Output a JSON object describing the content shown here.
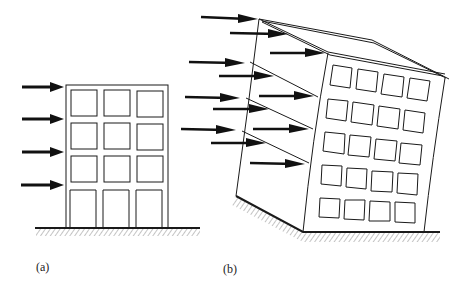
{
  "figure": {
    "panels": [
      {
        "id": "a",
        "label": "(a)",
        "description": "Upright 4-storey, 3-bay building frame with 4 lateral load arrows on its left side, standing on hatched ground",
        "storeys": 4,
        "bays": 3,
        "load_arrows": 4
      },
      {
        "id": "b",
        "label": "(b)",
        "description": "Perspective view of a 5-storey building deformed (tilted/swayed) under lateral wind loads, with many arrows acting on the side face, resting on hatched ground",
        "storeys": 5,
        "bays": 4,
        "load_arrows": 12
      }
    ],
    "colors": {
      "line": "#1a1a1a",
      "arrow": "#111111",
      "hatch": "#8a8a8a",
      "background": "#ffffff"
    }
  }
}
